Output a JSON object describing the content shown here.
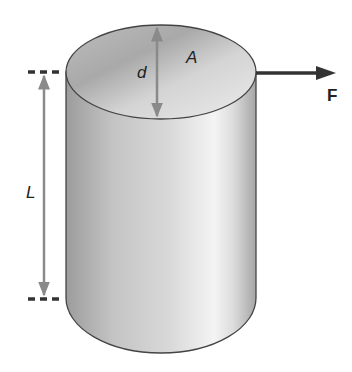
{
  "figure": {
    "type": "cylinder-stress-diagram",
    "labels": {
      "diameter": "d",
      "area": "A",
      "length": "L",
      "force": "F"
    },
    "colors": {
      "background": "#ffffff",
      "outline": "#444444",
      "dimension_arrow": "#8a8a8a",
      "force_arrow": "#333333",
      "dash": "#333333",
      "body_dark": "#9a9a9a",
      "body_light": "#f2f2f2",
      "top_face_dark": "#a8a8a8",
      "top_face_light": "#e6e6e6"
    }
  }
}
